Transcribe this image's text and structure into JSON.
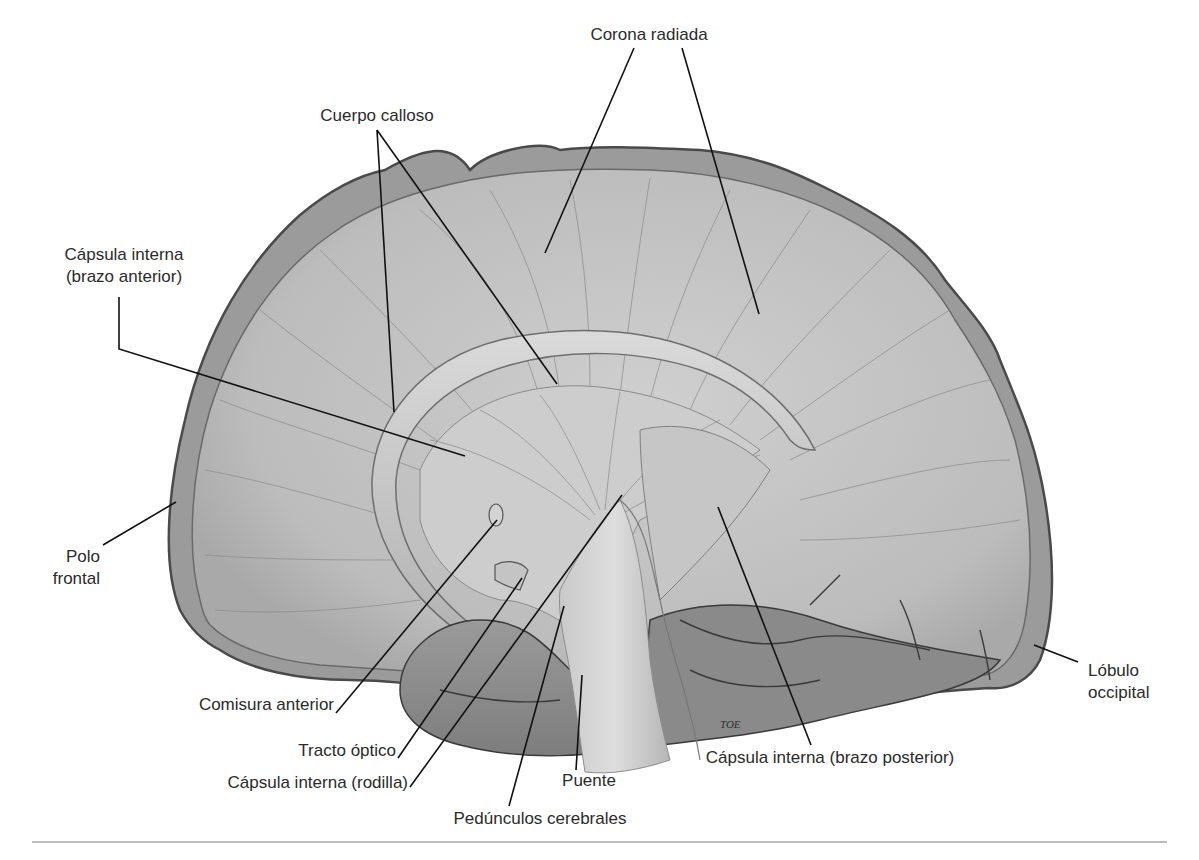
{
  "figure": {
    "type": "anatomical-illustration",
    "colors": {
      "tissue_fill": "#bdbdbd",
      "tissue_light": "#d2d2d2",
      "tissue_dark": "#8a8a8a",
      "outline": "#4a4a4a",
      "leader_line": "#111111",
      "label_text": "#2b2b2b",
      "background": "#ffffff",
      "bottom_rule": "#bdbdbd"
    },
    "signature": "TOE"
  },
  "labels": {
    "corona_radiada": "Corona radiada",
    "cuerpo_calloso": "Cuerpo calloso",
    "capsula_interna_brazo_anterior_line1": "Cápsula interna",
    "capsula_interna_brazo_anterior_line2": "(brazo anterior)",
    "polo_frontal_line1": "Polo",
    "polo_frontal_line2": "frontal",
    "lobulo_occipital_line1": "Lóbulo",
    "lobulo_occipital_line2": "occipital",
    "comisura_anterior": "Comisura anterior",
    "tracto_optico": "Tracto óptico",
    "capsula_interna_rodilla": "Cápsula interna (rodilla)",
    "pedunculos_cerebrales": "Pedúnculos cerebrales",
    "puente": "Puente",
    "capsula_interna_brazo_posterior": "Cápsula interna (brazo posterior)"
  }
}
